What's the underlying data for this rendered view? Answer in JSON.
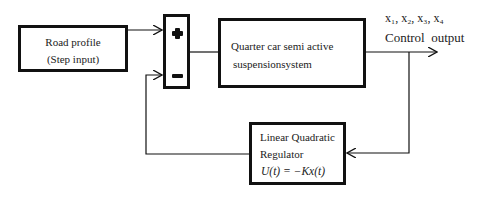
{
  "diagram": {
    "type": "control-loop block diagram",
    "blocks": {
      "road_profile": {
        "line1": "Road profile",
        "line2": "(Step input)"
      },
      "summing_junction": {
        "plus": "+",
        "minus": "−"
      },
      "plant": {
        "line1": "Quarter car semi active",
        "line2": "suspensionsystem"
      },
      "controller": {
        "line1": "Linear Quadratic",
        "line2": "Regulator",
        "equation": "U(t) = −Kx(t)"
      }
    },
    "labels": {
      "states": "x₁, x₂, x₃, x₄",
      "output": "Control  output"
    },
    "colors": {
      "line": "#111111",
      "background": "#ffffff"
    }
  }
}
